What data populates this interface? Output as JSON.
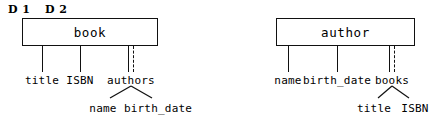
{
  "figure": {
    "type": "nested-relational-schema-diagram",
    "panel_labels": [
      {
        "id": "d1",
        "text": "D 1",
        "x": 8,
        "y": 3
      },
      {
        "id": "d2",
        "text": "D 2",
        "x": 45,
        "y": 3
      }
    ],
    "ink_color": "#111111",
    "background_color": "#ffffff"
  },
  "schemas": [
    {
      "id": "book-schema",
      "entity": {
        "name": "book",
        "box": {
          "x": 22,
          "y": 18,
          "width": 136,
          "height": 28
        }
      },
      "attributes": [
        {
          "name": "title",
          "multivalued": false,
          "line_x": 42,
          "line_top": 46,
          "line_bottom": 72,
          "label_x": 42,
          "label_y": 74
        },
        {
          "name": "ISBN",
          "multivalued": false,
          "line_x": 80,
          "line_top": 46,
          "line_bottom": 72,
          "label_x": 80,
          "label_y": 74
        },
        {
          "name": "authors",
          "multivalued": true,
          "line_x": 128,
          "line_top": 46,
          "line_bottom": 72,
          "label_x": 131,
          "label_y": 74,
          "children": [
            {
              "name": "name",
              "label_x": 103,
              "label_y": 102
            },
            {
              "name": "birth_date",
              "label_x": 158,
              "label_y": 102
            }
          ],
          "branch_apex_x": 131,
          "branch_apex_y": 86
        }
      ]
    },
    {
      "id": "author-schema",
      "entity": {
        "name": "author",
        "box": {
          "x": 276,
          "y": 18,
          "width": 139,
          "height": 28
        }
      },
      "attributes": [
        {
          "name": "name",
          "multivalued": false,
          "line_x": 288,
          "line_top": 46,
          "line_bottom": 72,
          "label_x": 288,
          "label_y": 74
        },
        {
          "name": "birth_date",
          "multivalued": false,
          "line_x": 337,
          "line_top": 46,
          "line_bottom": 72,
          "label_x": 337,
          "label_y": 74
        },
        {
          "name": "books",
          "multivalued": true,
          "line_x": 389,
          "line_top": 46,
          "line_bottom": 72,
          "label_x": 392,
          "label_y": 74,
          "children": [
            {
              "name": "title",
              "label_x": 374,
              "label_y": 102
            },
            {
              "name": "ISBN",
              "label_x": 415,
              "label_y": 102
            }
          ],
          "branch_apex_x": 392,
          "branch_apex_y": 86
        }
      ]
    }
  ]
}
